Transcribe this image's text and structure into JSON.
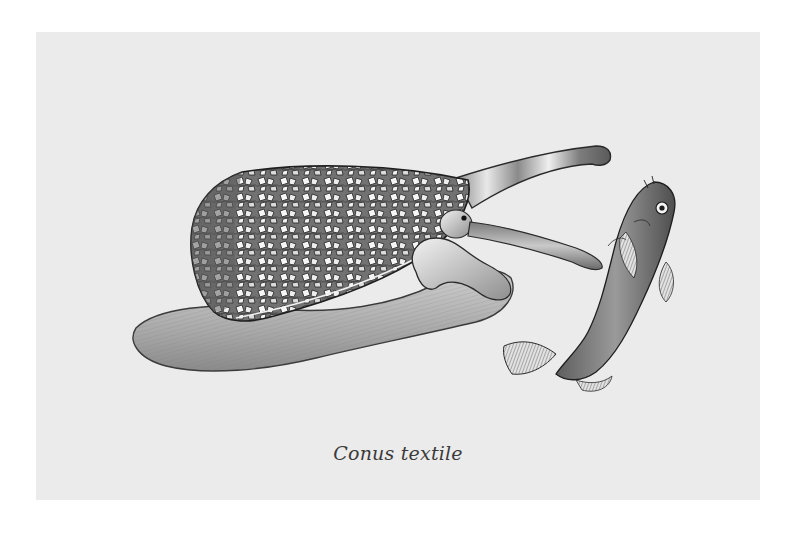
{
  "plate": {
    "caption": "Conus textile",
    "colors": {
      "page_background": "#ffffff",
      "plate_background": "#ebebeb",
      "ink": "#2a2a2a",
      "shell_mid": "#6e6e6e",
      "shell_light": "#f4f4f4",
      "foot": "#b9b9b9",
      "caption_text": "#3a3a3a"
    },
    "subjects": [
      {
        "name": "cone-snail",
        "parts": [
          "shell",
          "foot",
          "siphon",
          "head-with-eye",
          "proboscis"
        ]
      },
      {
        "name": "fish-prey",
        "parts": [
          "body",
          "eye",
          "pectoral-fin",
          "tail-fin",
          "dorsal-fin",
          "anal-fin"
        ]
      }
    ]
  }
}
